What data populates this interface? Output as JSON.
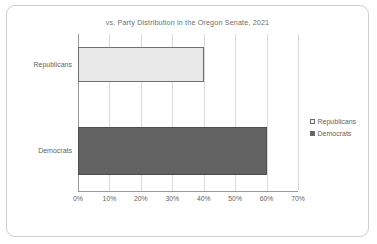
{
  "chart_data": {
    "type": "bar",
    "orientation": "horizontal",
    "title": "vs. Party Distribution  in the Oregon Senate, 2021",
    "xlabel": "",
    "ylabel": "",
    "categories": [
      "Republicans",
      "Democrats"
    ],
    "values": [
      40,
      60
    ],
    "value_suffix": "%",
    "xlim": [
      0,
      70
    ],
    "xticks": [
      0,
      10,
      20,
      30,
      40,
      50,
      60,
      70
    ],
    "xtick_labels": [
      "0%",
      "10%",
      "20%",
      "30%",
      "40%",
      "50%",
      "60%",
      "70%"
    ],
    "grid": true,
    "grid_axis": "x",
    "legend_position": "right",
    "series": [
      {
        "name": "Republicans",
        "value": 40,
        "color": "#e8e8e8",
        "border_color": "#6f6f6f"
      },
      {
        "name": "Democrats",
        "value": 60,
        "color": "#636363",
        "border_color": "#4d4d4d"
      }
    ],
    "legend": [
      {
        "label": "Republicans",
        "swatch": "#f2f2f2"
      },
      {
        "label": "Democrats",
        "swatch": "#636363"
      }
    ]
  },
  "colors": {
    "frame_border": "#cfcfcf",
    "gridline": "#dadada",
    "axis": "#9a9a9a",
    "text": "#5f5f5f",
    "title_text": "#6e6e6e",
    "background": "#ffffff"
  }
}
